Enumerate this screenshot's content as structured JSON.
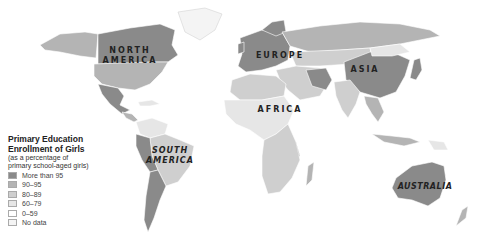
{
  "map": {
    "title_line1": "Primary Education",
    "title_line2": "Enrollment of Girls",
    "subtitle_line1": "(as a percentage of",
    "subtitle_line2": "primary school-aged girls)",
    "continent_labels": {
      "north_america_1": "NORTH",
      "north_america_2": "AMERICA",
      "south_america_1": "SOUTH",
      "south_america_2": "AMERICA",
      "europe": "EUROPE",
      "asia": "ASIA",
      "africa": "AFRICA",
      "australia": "AUSTRALIA"
    },
    "legend": [
      {
        "label": "More than 95",
        "color": "#8a8a8a"
      },
      {
        "label": "90–95",
        "color": "#b4b4b4"
      },
      {
        "label": "80–89",
        "color": "#cfcfcf"
      },
      {
        "label": "60–79",
        "color": "#e6e6e6"
      },
      {
        "label": "0–59",
        "color": "#ffffff"
      },
      {
        "label": "No data",
        "color": "#f4f4f4"
      }
    ]
  }
}
